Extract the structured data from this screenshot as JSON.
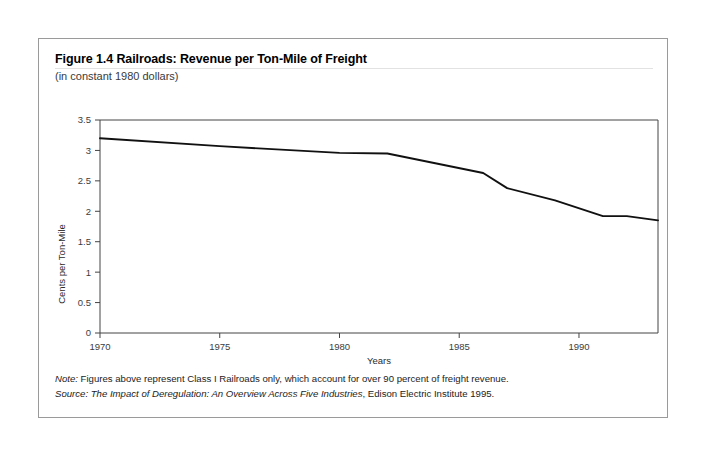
{
  "figure": {
    "title": "Figure 1.4 Railroads: Revenue per Ton-Mile of Freight",
    "subtitle": "(in constant 1980 dollars)",
    "note_label": "Note:",
    "note_text": " Figures above represent Class I Railroads only, which account for over 90 percent of freight revenue.",
    "source_label": "Source:",
    "source_title": " The Impact of Deregulation: An Overview Across Five Industries",
    "source_rest": ", Edison Electric Institute 1995."
  },
  "chart_data": {
    "type": "line",
    "title": "Figure 1.4 Railroads: Revenue per Ton-Mile of Freight",
    "subtitle": "(in constant 1980 dollars)",
    "xlabel": "Years",
    "ylabel": "Cents per Ton-Mile",
    "xlim": [
      1970,
      1993.3
    ],
    "ylim": [
      0,
      3.5
    ],
    "xticks": [
      1970,
      1975,
      1980,
      1985,
      1990
    ],
    "xtick_labels": [
      "1970",
      "1975",
      "1980",
      "1985",
      "1990"
    ],
    "yticks": [
      0,
      0.5,
      1,
      1.5,
      2,
      2.5,
      3,
      3.5
    ],
    "ytick_labels": [
      "0",
      "0.5",
      "1",
      "1.5",
      "2",
      "2.5",
      "3",
      "3.5"
    ],
    "grid": false,
    "legend": null,
    "line_color": "#111111",
    "series": [
      {
        "name": "Revenue per Ton-Mile",
        "x": [
          1970,
          1975,
          1980,
          1982,
          1984,
          1986,
          1987,
          1989,
          1991,
          1992,
          1993.3
        ],
        "values": [
          3.2,
          3.07,
          2.96,
          2.95,
          2.79,
          2.63,
          2.38,
          2.18,
          1.92,
          1.92,
          1.85
        ]
      }
    ]
  }
}
